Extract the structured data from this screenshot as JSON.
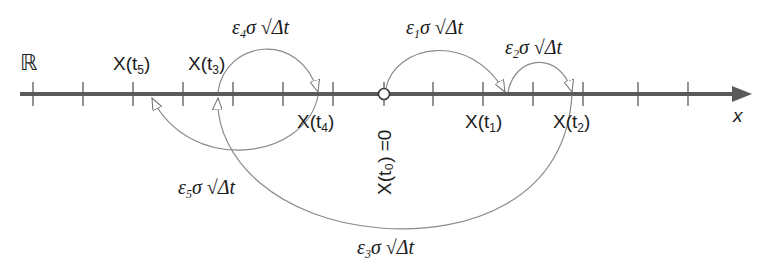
{
  "diagram": {
    "set_symbol": "ℝ",
    "axis_label": "x",
    "origin_label": "X(t₀) =0",
    "colors": {
      "axis": "#5a5a5a",
      "arc": "#8a8a8a",
      "text": "#1c1c1c"
    },
    "ticks_x": [
      33,
      83,
      133,
      183,
      233,
      283,
      333,
      433,
      483,
      533,
      583,
      638,
      688
    ],
    "points": [
      {
        "name": "X(t5)",
        "label_prefix": "X(t",
        "sub": "5",
        "label_suffix": ")"
      },
      {
        "name": "X(t3)",
        "label_prefix": "X(t",
        "sub": "3",
        "label_suffix": ")"
      },
      {
        "name": "X(t4)",
        "label_prefix": "X(t",
        "sub": "4",
        "label_suffix": ")"
      },
      {
        "name": "X(t1)",
        "label_prefix": "X(t",
        "sub": "1",
        "label_suffix": ")"
      },
      {
        "name": "X(t2)",
        "label_prefix": "X(t",
        "sub": "2",
        "label_suffix": ")"
      }
    ],
    "steps": [
      {
        "eps": "ε",
        "sub": "1",
        "rest": "σ √Δt",
        "from": "X(t0)",
        "to": "X(t1)"
      },
      {
        "eps": "ε",
        "sub": "2",
        "rest": "σ √Δt",
        "from": "X(t1)",
        "to": "X(t2)"
      },
      {
        "eps": "ε",
        "sub": "3",
        "rest": "σ √Δt",
        "from": "X(t2)",
        "to": "X(t3)"
      },
      {
        "eps": "ε",
        "sub": "4",
        "rest": "σ √Δt",
        "from": "X(t3)",
        "to": "X(t4)"
      },
      {
        "eps": "ε",
        "sub": "5",
        "rest": "σ √Δt",
        "from": "X(t4)",
        "to": "X(t5)"
      }
    ]
  }
}
